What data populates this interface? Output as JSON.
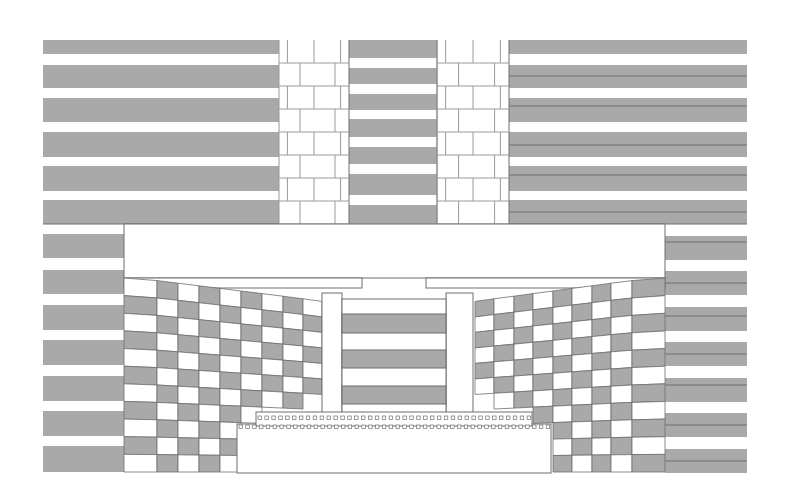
{
  "colors": {
    "background": "#ffffff",
    "gray_fill": "#a9a9a9",
    "line": "#6e6e6e",
    "light_line": "#9a9a9a"
  },
  "upper_left_stripes": {
    "x": 43,
    "width": 236,
    "bands": [
      [
        40,
        54
      ],
      [
        65,
        88
      ],
      [
        98,
        122
      ],
      [
        132,
        157
      ],
      [
        166,
        191
      ],
      [
        200,
        224
      ]
    ]
  },
  "upper_brick_left": {
    "x": 279,
    "width": 70,
    "y": 40,
    "height": 184,
    "rows": 8
  },
  "upper_center_stripes": {
    "x": 349,
    "width": 88,
    "bands": [
      [
        40,
        58
      ],
      [
        68,
        84
      ],
      [
        94,
        110
      ],
      [
        119,
        137
      ],
      [
        147,
        164
      ],
      [
        174,
        195
      ],
      [
        205,
        224
      ]
    ]
  },
  "upper_brick_right": {
    "x": 437,
    "width": 72,
    "y": 40,
    "height": 184,
    "rows": 8
  },
  "upper_right_stripes": {
    "x": 509,
    "width": 238,
    "bands": [
      [
        40,
        54
      ],
      [
        65,
        88
      ],
      [
        98,
        122
      ],
      [
        132,
        157
      ],
      [
        166,
        191
      ],
      [
        200,
        224
      ]
    ],
    "split_lines": [
      76,
      106,
      145,
      175,
      212
    ]
  },
  "lower_left_stripes": {
    "x": 43,
    "width": 81,
    "bands": [
      [
        234,
        258
      ],
      [
        270,
        294
      ],
      [
        305,
        330
      ],
      [
        340,
        365
      ],
      [
        376,
        401
      ],
      [
        411,
        436
      ],
      [
        446,
        472
      ]
    ]
  },
  "lower_right_stripes": {
    "x": 665,
    "width": 82,
    "bands": [
      [
        236,
        260
      ],
      [
        271,
        295
      ],
      [
        307,
        331
      ],
      [
        342,
        366
      ],
      [
        378,
        402
      ],
      [
        413,
        437
      ],
      [
        449,
        473
      ]
    ],
    "split_lines": [
      242,
      283,
      316,
      354,
      385,
      425,
      461
    ]
  },
  "beam": {
    "x": 124,
    "y": 224,
    "width": 541,
    "height": 54
  },
  "left_checker": {
    "cols_x": [
      124,
      157,
      178,
      199,
      220,
      241,
      262,
      283,
      303
    ],
    "top_y": [
      278,
      281,
      284,
      288,
      291,
      294,
      297,
      300,
      303,
      306
    ],
    "rows": 11,
    "row_h": 18.2
  },
  "right_checker": {
    "cols_x": [
      475,
      494,
      514,
      533,
      553,
      572,
      592,
      611,
      632,
      665
    ],
    "rows": 11
  },
  "pillar_left": {
    "x": 322,
    "y": 293,
    "width": 20,
    "height": 120
  },
  "pillar_right": {
    "x": 446,
    "y": 293,
    "width": 27,
    "height": 120
  },
  "center_panel": {
    "x": 342,
    "y": 299,
    "width": 104,
    "height": 114,
    "bands": [
      [
        314,
        333
      ],
      [
        350,
        368
      ],
      [
        386,
        404
      ]
    ]
  },
  "dentil_rows": [
    {
      "x": 256,
      "y": 414,
      "width": 276,
      "count": 40
    },
    {
      "x": 237,
      "y": 424,
      "width": 314,
      "count": 46
    }
  ],
  "base_opening": {
    "x": 237,
    "y": 428,
    "width": 314,
    "height": 45
  }
}
